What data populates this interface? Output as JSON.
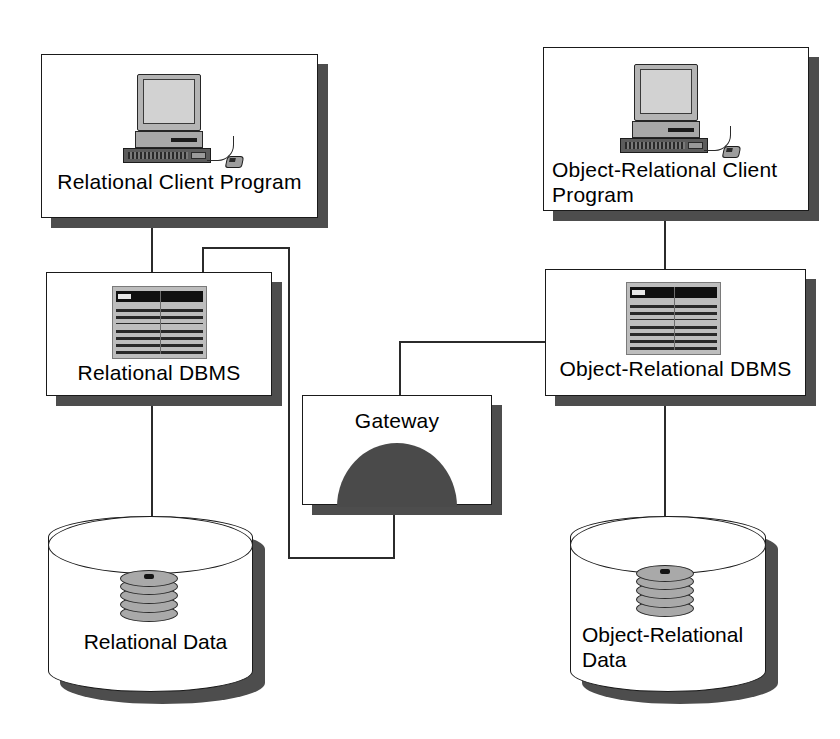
{
  "diagram": {
    "background_color": "#ffffff",
    "line_color": "#2b2b2b",
    "shadow_color": "#4d4d4d",
    "dome_color": "#4a4a4a"
  },
  "nodes": {
    "relational_client": {
      "label": "Relational Client Program",
      "icon": "desktop-computer-icon"
    },
    "object_relational_client": {
      "label": "Object-Relational Client\nProgram",
      "icon": "desktop-computer-icon"
    },
    "relational_dbms": {
      "label": "Relational DBMS",
      "icon": "database-table-icon"
    },
    "object_relational_dbms": {
      "label": "Object-Relational DBMS",
      "icon": "database-table-icon"
    },
    "gateway": {
      "label": "Gateway",
      "icon": "gateway-dome-icon"
    },
    "relational_data": {
      "label": "Relational Data",
      "icon": "disk-stack-icon"
    },
    "object_relational_data": {
      "label": "Object-Relational\nData",
      "icon": "disk-stack-icon"
    }
  },
  "connections": [
    {
      "name": "relational-client-to-relational-dbms",
      "from": "relational_client",
      "to": "relational_dbms"
    },
    {
      "name": "relational-dbms-to-relational-data",
      "from": "relational_dbms",
      "to": "relational_data"
    },
    {
      "name": "object-relational-client-to-object-relational-dbms",
      "from": "object_relational_client",
      "to": "object_relational_dbms"
    },
    {
      "name": "object-relational-dbms-to-object-relational-data",
      "from": "object_relational_dbms",
      "to": "object_relational_data"
    },
    {
      "name": "relational-dbms-to-gateway",
      "from": "relational_dbms",
      "to": "gateway"
    },
    {
      "name": "gateway-to-object-relational-dbms",
      "from": "gateway",
      "to": "object_relational_dbms"
    }
  ]
}
